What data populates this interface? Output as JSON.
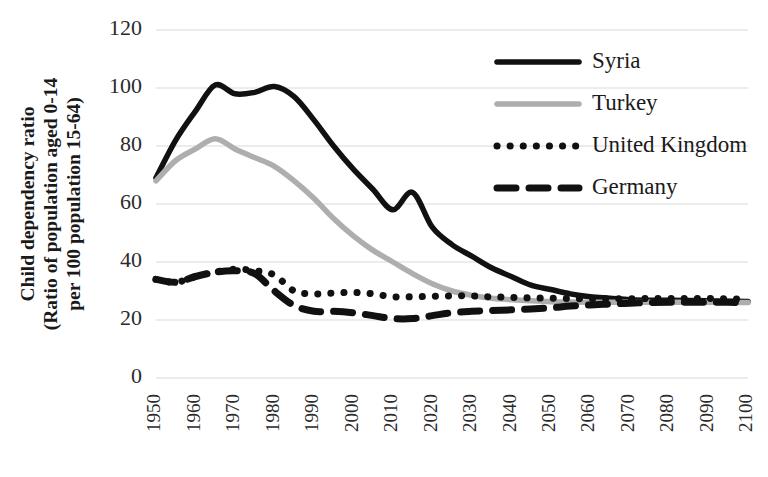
{
  "chart_data": {
    "type": "line",
    "title": "",
    "xlabel": "",
    "ylabel": "Child dependency ratio\n(Ratio of population aged 0-14\nper 100 population 15-64)",
    "ylabel_lines": [
      "Child dependency ratio",
      "(Ratio of population aged 0-14",
      "per 100 population 15-64)"
    ],
    "ylim": [
      0,
      120
    ],
    "ytick_labels": [
      "0",
      "20",
      "40",
      "60",
      "80",
      "100",
      "120"
    ],
    "yticks": [
      0,
      20,
      40,
      60,
      80,
      100,
      120
    ],
    "xlim": [
      1950,
      2100
    ],
    "xtick_labels": [
      "1950",
      "1960",
      "1970",
      "1980",
      "1990",
      "2000",
      "2010",
      "2020",
      "2030",
      "2040",
      "2050",
      "2060",
      "2070",
      "2080",
      "2090",
      "2100"
    ],
    "xticks": [
      1950,
      1960,
      1970,
      1980,
      1990,
      2000,
      2010,
      2020,
      2030,
      2040,
      2050,
      2060,
      2070,
      2080,
      2090,
      2100
    ],
    "grid": true,
    "grid_axis": "y",
    "legend_position": "upper-right",
    "x": [
      1950,
      1955,
      1960,
      1965,
      1970,
      1975,
      1980,
      1985,
      1990,
      1995,
      2000,
      2005,
      2010,
      2015,
      2020,
      2025,
      2030,
      2035,
      2040,
      2045,
      2050,
      2055,
      2060,
      2065,
      2070,
      2075,
      2080,
      2085,
      2090,
      2095,
      2100
    ],
    "series": [
      {
        "name": "Syria",
        "color": "#111111",
        "style": "solid",
        "values": [
          69,
          82,
          92,
          101,
          98,
          98.5,
          100.5,
          97,
          89,
          80,
          72,
          65,
          58,
          64,
          52,
          46,
          42,
          38,
          35,
          32,
          30.5,
          29,
          28,
          27.5,
          27,
          26.8,
          26.8,
          26.7,
          26.6,
          26.5,
          26.4
        ]
      },
      {
        "name": "Turkey",
        "color": "#aeaeae",
        "style": "solid",
        "values": [
          68,
          75,
          79,
          82.5,
          79,
          76,
          73,
          68,
          62,
          55,
          49,
          44,
          40,
          36,
          32.5,
          30,
          28.5,
          27.5,
          27,
          26.6,
          26.3,
          26.2,
          26.1,
          26.1,
          26.1,
          26.1,
          26.1,
          26.1,
          26.1,
          26.1,
          26
        ]
      },
      {
        "name": "United Kingdom",
        "color": "#111111",
        "style": "dotted",
        "values": [
          34,
          33,
          35,
          36.5,
          37.5,
          37,
          35.5,
          30,
          29,
          29.3,
          29.5,
          29,
          28,
          28,
          28.2,
          28.3,
          28.3,
          28,
          27.8,
          27.6,
          27.5,
          27.4,
          27.3,
          27.3,
          27.3,
          27.4,
          27.4,
          27.4,
          27.4,
          27.3,
          27.2
        ]
      },
      {
        "name": "Germany",
        "color": "#111111",
        "style": "dashed",
        "values": [
          34,
          33,
          35,
          36.5,
          37,
          36,
          30,
          25,
          23,
          23,
          22.5,
          21.5,
          20.5,
          20.5,
          21.5,
          22.5,
          23,
          23.3,
          23.5,
          23.8,
          24.2,
          24.8,
          25.2,
          25.5,
          25.8,
          26,
          26.1,
          26.1,
          26.1,
          26.1,
          26
        ]
      }
    ]
  },
  "legend": {
    "entries": [
      {
        "label": "Syria",
        "style": "solid",
        "color": "#111111"
      },
      {
        "label": "Turkey",
        "style": "solid",
        "color": "#aeaeae"
      },
      {
        "label": "United Kingdom",
        "style": "dotted",
        "color": "#111111"
      },
      {
        "label": "Germany",
        "style": "dashed",
        "color": "#111111"
      }
    ]
  }
}
